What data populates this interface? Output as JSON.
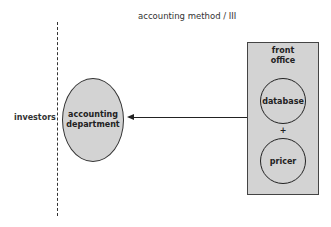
{
  "diagram": {
    "title": "accounting method / III",
    "boundary_label": "investors",
    "accounting_node": {
      "line1": "accounting",
      "line2": "department"
    },
    "front_office": {
      "label_line1": "front",
      "label_line2": "office",
      "components": [
        "database",
        "pricer"
      ],
      "operator": "+"
    },
    "edges": [
      {
        "from": "front office",
        "to": "accounting department",
        "type": "arrow"
      }
    ],
    "colors": {
      "fill": "#d3d3d3",
      "stroke": "#222222"
    }
  }
}
